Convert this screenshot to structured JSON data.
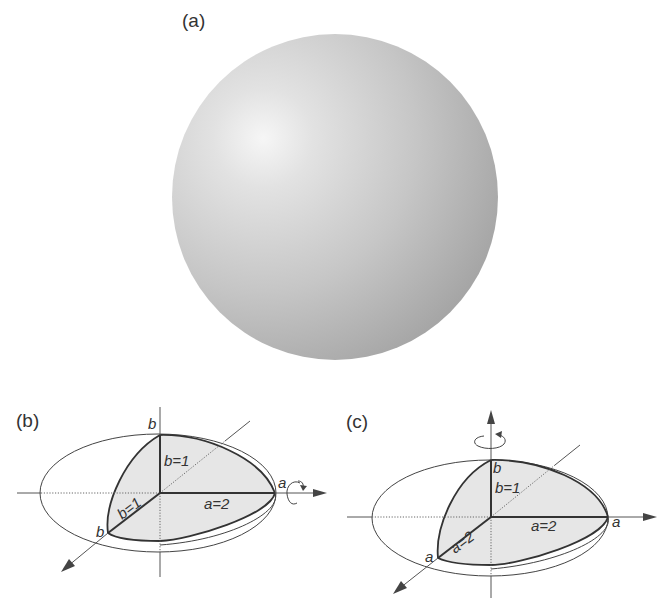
{
  "figure": {
    "panel_a": {
      "label": "(a)",
      "description": "shaded sphere",
      "colors": {
        "highlight": "#f4f4f4",
        "mid": "#c8c8c8",
        "shadow": "#9c9c9c"
      }
    },
    "panel_b": {
      "label": "(b)",
      "rotation_axis": "horizontal (a-axis)",
      "labels": {
        "top_vertex": "b",
        "front_vertex": "b",
        "right_vertex": "a",
        "vertical_semi_axis": "b=1",
        "diagonal_semi_axis": "b=1",
        "horizontal_semi_axis": "a=2"
      }
    },
    "panel_c": {
      "label": "(c)",
      "rotation_axis": "vertical (b-axis)",
      "labels": {
        "top_vertex": "b",
        "front_vertex": "a",
        "right_vertex": "a",
        "vertical_semi_axis": "b=1",
        "diagonal_semi_axis": "a=2",
        "horizontal_semi_axis": "a=2"
      }
    },
    "colors": {
      "shaded_region": "#e6e6e6",
      "line": "#333333"
    }
  }
}
